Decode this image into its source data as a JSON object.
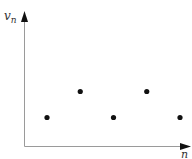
{
  "chart_data": {
    "type": "scatter",
    "title": "",
    "xlabel": "n",
    "ylabel": "v_n",
    "ylabel_base": "v",
    "ylabel_sub": "n",
    "x": [
      1,
      2,
      3,
      4,
      5
    ],
    "values": [
      1,
      2,
      1,
      2,
      1
    ],
    "grid": false,
    "legend": null,
    "ticks": "none"
  },
  "colors": {
    "axis": "#9a9a9a",
    "arrow": "#111111",
    "points": "#111111"
  }
}
